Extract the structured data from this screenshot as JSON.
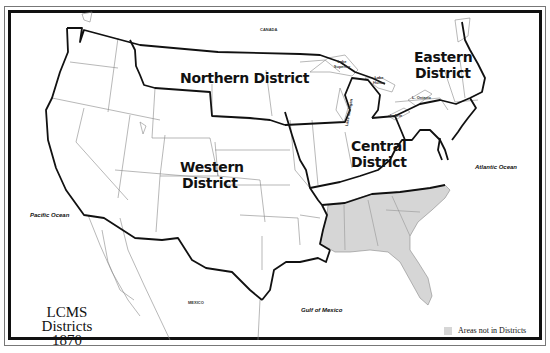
{
  "title": {
    "line1": "LCMS",
    "line2": "Districts",
    "line3": "1870"
  },
  "districts": {
    "northern": "Northern District",
    "eastern_line1": "Eastern",
    "eastern_line2": "District",
    "central_line1": "Central",
    "central_line2": "District",
    "western_line1": "Western",
    "western_line2": "District"
  },
  "places": {
    "canada": "CANADA",
    "mexico": "MEXICO",
    "pacific": "Pacific Ocean",
    "atlantic": "Atlantic Ocean",
    "gulf": "Gulf of Mexico",
    "lake_superior": "Lake Superior",
    "lake_huron": "Lake Huron",
    "lake_michigan": "Lake Michigan",
    "lake_ontario": "L. Ontario",
    "lake_erie": "L. Erie"
  },
  "legend": {
    "label": "Areas not in Districts",
    "color": "#d6d6d6"
  },
  "colors": {
    "border": "#111111",
    "state_line": "#777777",
    "shaded": "#d6d6d6"
  }
}
